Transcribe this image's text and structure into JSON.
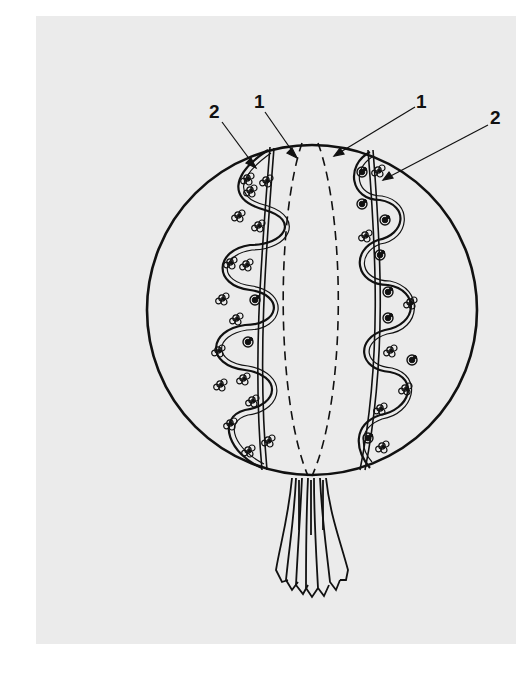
{
  "figure": {
    "background_color": "#ffffff",
    "panel_color": "#ebebeb",
    "ink_color": "#111111",
    "labels": [
      {
        "id": "label-2-left",
        "text": "2",
        "x": 216,
        "y": 118,
        "points_to": "left spiral chain"
      },
      {
        "id": "label-1-left",
        "text": "1",
        "x": 260,
        "y": 108,
        "points_to": "left dashed meridian"
      },
      {
        "id": "label-1-right",
        "text": "1",
        "x": 421,
        "y": 108,
        "points_to": "right dashed meridian"
      },
      {
        "id": "label-2-right",
        "text": "2",
        "x": 496,
        "y": 124,
        "points_to": "right spiral chain"
      }
    ],
    "parts": {
      "sphere": {
        "cx": 312,
        "cy": 310,
        "r": 165
      },
      "meridians": 2,
      "spiral_chains": 2,
      "stalk": "fringed tassel below sphere"
    }
  }
}
